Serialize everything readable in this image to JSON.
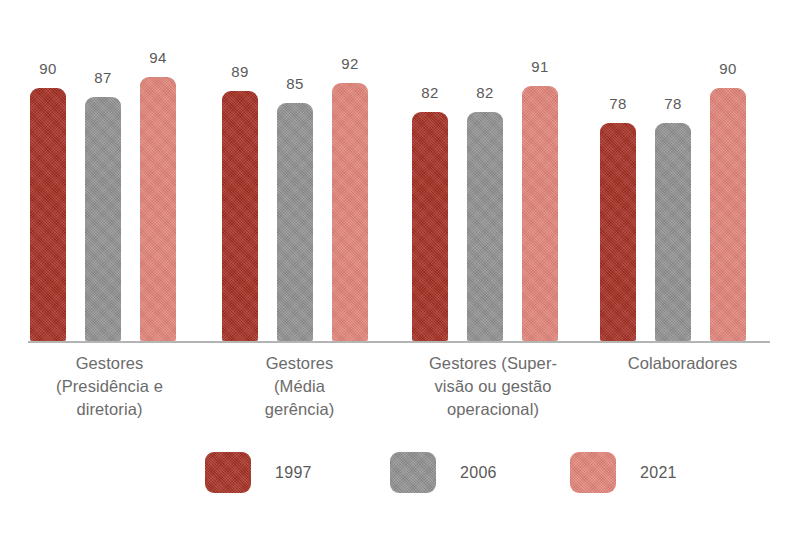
{
  "chart_data": {
    "type": "bar",
    "title": "",
    "subtitle": "",
    "xlabel": "",
    "ylabel": "",
    "grid": false,
    "legend_position": "bottom",
    "value_labels": true,
    "ylim": [
      0,
      100
    ],
    "categories": [
      "Gestores (Presidência e diretoria)",
      "Gestores (Média gerência)",
      "Gestores (Supervisão ou gestão operacional)",
      "Colaboradores"
    ],
    "category_lines": [
      [
        "Gestores",
        "(Presidência e",
        "diretoria)"
      ],
      [
        "Gestores",
        "(Média",
        "gerência)"
      ],
      [
        "Gestores (Super-",
        "visão ou gestão",
        "operacional)"
      ],
      [
        "Colaboradores"
      ]
    ],
    "series": [
      {
        "name": "1997",
        "color": "#A63024",
        "values": [
          90,
          89,
          82,
          78
        ]
      },
      {
        "name": "2006",
        "color": "#919191",
        "values": [
          87,
          85,
          82,
          78
        ]
      },
      {
        "name": "2021",
        "color": "#E3857A",
        "values": [
          94,
          92,
          91,
          90
        ]
      }
    ]
  },
  "legend": {
    "items": [
      {
        "label": "1997",
        "color": "#A63024"
      },
      {
        "label": "2006",
        "color": "#919191"
      },
      {
        "label": "2021",
        "color": "#E3857A"
      }
    ]
  },
  "colors": {
    "series_1997": "#A63024",
    "series_2006": "#919191",
    "series_2021": "#E3857A",
    "axis_line": "#B4B4B4",
    "label_text": "#6B6B6B",
    "value_text": "#5A5A5A",
    "background": "#FFFFFF"
  }
}
